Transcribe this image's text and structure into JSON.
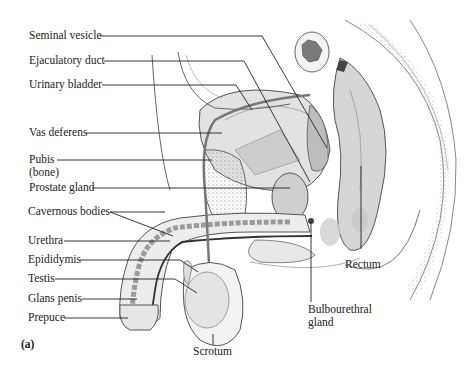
{
  "figure_label": "(a)",
  "labels": {
    "seminal_vesicle": "Seminal vesicle",
    "ejaculatory_duct": "Ejaculatory duct",
    "urinary_bladder": "Urinary bladder",
    "vas_deferens": "Vas deferens",
    "pubis": "Pubis",
    "pubis_sub": "(bone)",
    "prostate_gland": "Prostate gland",
    "cavernous_bodies": "Cavernous bodies",
    "urethra": "Urethra",
    "epididymis": "Epididymis",
    "testis": "Testis",
    "glans_penis": "Glans penis",
    "prepuce": "Prepuce",
    "scrotum": "Scrotum",
    "rectum": "Rectum",
    "bulbourethral_1": "Bulbourethral",
    "bulbourethral_2": "gland"
  },
  "colors": {
    "ink": "#222222",
    "outline": "#555555",
    "shade": "#cfcfcf",
    "dark": "#6a6a6a"
  }
}
